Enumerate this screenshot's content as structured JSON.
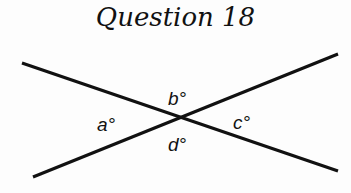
{
  "title": "Question 18",
  "diagram": {
    "type": "intersecting-lines",
    "lines": [
      {
        "name": "line-1",
        "x1": 22,
        "y1": 63,
        "x2": 338,
        "y2": 171
      },
      {
        "name": "line-2",
        "x1": 33,
        "y1": 177,
        "x2": 338,
        "y2": 54
      }
    ],
    "intersection": {
      "x": 180,
      "y": 117
    },
    "angle_labels": [
      {
        "id": "a",
        "text": "a°",
        "x": 97,
        "y": 131
      },
      {
        "id": "b",
        "text": "b°",
        "x": 168,
        "y": 105
      },
      {
        "id": "c",
        "text": "c°",
        "x": 233,
        "y": 129
      },
      {
        "id": "d",
        "text": "d°",
        "x": 168,
        "y": 151
      }
    ],
    "line_color": "#111111"
  }
}
